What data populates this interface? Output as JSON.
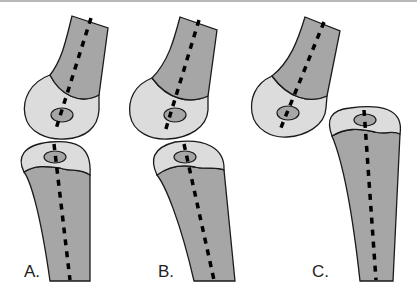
{
  "figure": {
    "panels": [
      {
        "label": "A.",
        "label_x": 24,
        "label_y": 262
      },
      {
        "label": "B.",
        "label_x": 158,
        "label_y": 262
      },
      {
        "label": "C.",
        "label_x": 312,
        "label_y": 262
      }
    ]
  },
  "colors": {
    "shaft": "#a6a6a6",
    "epiphysis": "#dcdcdc",
    "ossification_center": "#a6a6a6",
    "outline": "#1a1a1a",
    "axis_line": "#000000"
  }
}
